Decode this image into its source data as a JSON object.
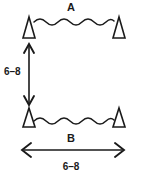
{
  "diagram": {
    "title": "A",
    "labels": {
      "top_side": "A",
      "bottom_side": "B",
      "vertical_dimension": "6–8",
      "horizontal_dimension": "6–8"
    },
    "markers": [
      {
        "name": "top-left-triangle",
        "position": "top-left"
      },
      {
        "name": "top-right-triangle",
        "position": "top-right"
      },
      {
        "name": "bottom-left-triangle",
        "position": "bottom-left"
      },
      {
        "name": "bottom-right-triangle",
        "position": "bottom-right"
      }
    ],
    "connectors": [
      {
        "name": "top-wavy-line",
        "style": "wavy",
        "between": "A"
      },
      {
        "name": "bottom-wavy-line",
        "style": "wavy",
        "between": "B"
      }
    ],
    "dimensions": [
      {
        "name": "vertical-dimension",
        "orientation": "vertical",
        "value": "6–8",
        "arrow": "double-headed"
      },
      {
        "name": "horizontal-dimension",
        "orientation": "horizontal",
        "value": "6–8",
        "arrow": "double-headed",
        "side_label": "B"
      }
    ],
    "colors": {
      "background": "#ffffff",
      "ink": "#1a1a1a"
    }
  }
}
